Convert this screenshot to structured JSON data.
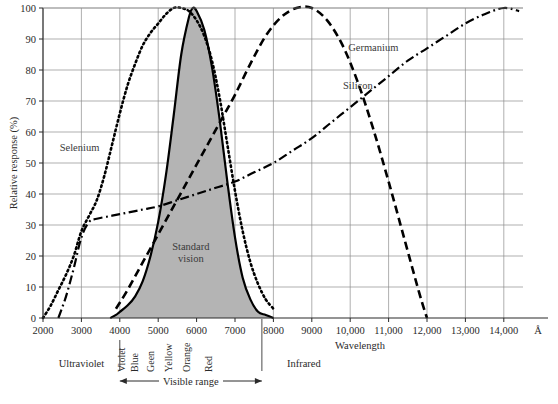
{
  "chart_data": {
    "type": "line",
    "title": "",
    "xlabel": "Wavelength",
    "ylabel": "Relative response (%)",
    "x_unit": "Å",
    "xlim": [
      2000,
      14500
    ],
    "ylim": [
      0,
      100
    ],
    "grid": true,
    "legend_position": "inline-annotations",
    "x_ticks": [
      "2000",
      "3000",
      "4000",
      "5000",
      "6000",
      "7000",
      "8000",
      "9000",
      "10,000",
      "11,000",
      "12,000",
      "13,000",
      "14,000"
    ],
    "x_tick_values": [
      2000,
      3000,
      4000,
      5000,
      6000,
      7000,
      8000,
      9000,
      10000,
      11000,
      12000,
      13000,
      14000
    ],
    "y_ticks": [
      "0",
      "10",
      "20",
      "30",
      "40",
      "50",
      "60",
      "70",
      "80",
      "90",
      "100"
    ],
    "y_tick_values": [
      0,
      10,
      20,
      30,
      40,
      50,
      60,
      70,
      80,
      90,
      100
    ],
    "series": [
      {
        "name": "Standard vision",
        "style": "solid-filled",
        "fill": "#b4b4b4",
        "color": "#000000",
        "x": [
          3750,
          3900,
          4000,
          4200,
          4400,
          4600,
          4800,
          5000,
          5200,
          5400,
          5600,
          5800,
          5900,
          6000,
          6200,
          6400,
          6600,
          6800,
          7000,
          7200,
          7400,
          7600,
          7800,
          8000
        ],
        "y": [
          0,
          1,
          2,
          4,
          7,
          12,
          20,
          31,
          46,
          65,
          85,
          97,
          100,
          99,
          93,
          81,
          64,
          44,
          26,
          13,
          6,
          2,
          1,
          0
        ]
      },
      {
        "name": "Selenium",
        "style": "dotted",
        "color": "#000000",
        "x": [
          2000,
          2200,
          2400,
          2600,
          2800,
          3000,
          3200,
          3400,
          3600,
          3800,
          4000,
          4200,
          4400,
          4600,
          4800,
          5000,
          5200,
          5400,
          5600,
          5800,
          6000,
          6200,
          6400,
          6600,
          6800,
          7000,
          7200,
          7400,
          7600,
          7800,
          8000
        ],
        "y": [
          0,
          4,
          9,
          14,
          20,
          28,
          33,
          38,
          46,
          56,
          66,
          75,
          82,
          88,
          92,
          95,
          98,
          100,
          100,
          99,
          96,
          91,
          83,
          71,
          56,
          41,
          28,
          18,
          11,
          6,
          3
        ]
      },
      {
        "name": "Silicon",
        "style": "dashed",
        "color": "#000000",
        "x": [
          3900,
          4200,
          4600,
          5000,
          5400,
          5800,
          6200,
          6600,
          7000,
          7400,
          7800,
          8200,
          8600,
          9000,
          9400,
          9800,
          10200,
          10600,
          11000,
          11400,
          11800,
          12000
        ],
        "y": [
          3,
          9,
          18,
          27,
          36,
          45,
          54,
          63,
          72,
          82,
          91,
          97,
          100,
          100,
          96,
          88,
          76,
          61,
          44,
          26,
          8,
          0
        ]
      },
      {
        "name": "Germanium",
        "style": "dash-dot",
        "color": "#000000",
        "x": [
          2400,
          2600,
          2800,
          3000,
          3200,
          3400,
          3800,
          4200,
          4600,
          5000,
          5500,
          6000,
          6500,
          7000,
          7500,
          8000,
          8500,
          9000,
          9500,
          10000,
          10500,
          11000,
          11500,
          12000,
          12500,
          13000,
          13500,
          14000,
          14400
        ],
        "y": [
          0,
          7,
          16,
          26,
          31,
          32,
          33,
          34,
          35,
          36,
          38,
          40,
          42,
          44,
          47,
          50,
          54,
          58,
          63,
          68,
          73,
          78,
          83,
          87,
          91,
          95,
          98,
          100,
          99
        ]
      }
    ],
    "annotations": [
      {
        "text": "Standard vision",
        "x": 5850,
        "y": 22
      },
      {
        "text": "Selenium",
        "x": 2950,
        "y": 54
      },
      {
        "text": "Silicon",
        "x": 10200,
        "y": 74
      },
      {
        "text": "Germanium",
        "x": 10600,
        "y": 86
      }
    ]
  },
  "axes": {
    "x_title": "Wavelength",
    "x_unit_symbol": "Å",
    "y_title": "Relative response (%)"
  },
  "spectrum": {
    "bands": [
      {
        "name": "Ultraviolet"
      },
      {
        "name": "Infrared"
      }
    ],
    "visible_range_label": "Visible range",
    "visible_start": 4000,
    "visible_end": 7700,
    "colors": [
      {
        "label": "Violet",
        "x": 4130
      },
      {
        "label": "Blue",
        "x": 4480
      },
      {
        "label": "Geen",
        "x": 4900
      },
      {
        "label": "Yellow",
        "x": 5370
      },
      {
        "label": "Orange",
        "x": 5820
      },
      {
        "label": "Red",
        "x": 6400
      }
    ]
  }
}
